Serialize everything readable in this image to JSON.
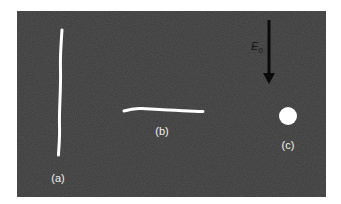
{
  "figure": {
    "background_color": "#3a3a3a",
    "object_color": "#ffffff",
    "arrow_color": "#0a0a0a",
    "field": {
      "symbol": "E",
      "subscript": "0",
      "direction": "down"
    },
    "objects": [
      {
        "id": "a",
        "label": "(a)",
        "shape": "vertical-line"
      },
      {
        "id": "b",
        "label": "(b)",
        "shape": "horizontal-line"
      },
      {
        "id": "c",
        "label": "(c)",
        "shape": "dot"
      }
    ]
  }
}
